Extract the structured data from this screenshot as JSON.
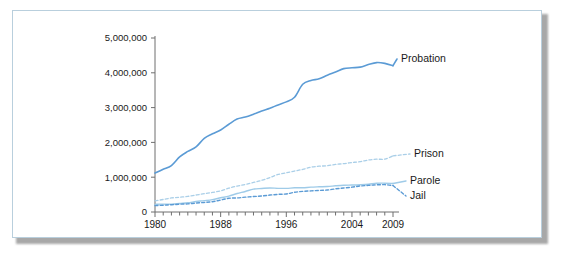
{
  "chart_data": {
    "type": "line",
    "title": "",
    "xlabel": "",
    "ylabel": "",
    "xlim": [
      1980,
      2009
    ],
    "ylim": [
      0,
      5000000
    ],
    "grid": false,
    "legend_position": "inline-right",
    "ytick_labels": [
      "0",
      "1,000,000",
      "2,000,000",
      "3,000,000",
      "4,000,000",
      "5,000,000"
    ],
    "ytick_values": [
      0,
      1000000,
      2000000,
      3000000,
      4000000,
      5000000
    ],
    "xtick_labels": [
      "1980",
      "1988",
      "1996",
      "2004",
      "2009"
    ],
    "xtick_values": [
      1980,
      1988,
      1996,
      2004,
      2009
    ],
    "x_minor_tick_interval": 1,
    "x": [
      1980,
      1981,
      1982,
      1983,
      1984,
      1985,
      1986,
      1987,
      1988,
      1989,
      1990,
      1991,
      1992,
      1993,
      1994,
      1995,
      1996,
      1997,
      1998,
      1999,
      2000,
      2001,
      2002,
      2003,
      2004,
      2005,
      2006,
      2007,
      2008,
      2009
    ],
    "series": [
      {
        "name": "Probation",
        "label": "Probation",
        "color": "#5b9bd5",
        "style": "solid",
        "width": 1.6,
        "values": [
          1118097,
          1225934,
          1335359,
          1582947,
          1740948,
          1870132,
          2114621,
          2247158,
          2356483,
          2522125,
          2670234,
          2728472,
          2811611,
          2903061,
          2981022,
          3077861,
          3164996,
          3296513,
          3670441,
          3779922,
          3826209,
          3931731,
          4024067,
          4120012,
          4143792,
          4162536,
          4236800,
          4293163,
          4270917,
          4203967
        ]
      },
      {
        "name": "Prison",
        "label": "Prison",
        "color": "#aacfe8",
        "style": "dashed",
        "width": 1.3,
        "values": [
          319598,
          360029,
          402914,
          423898,
          448264,
          487593,
          526436,
          562814,
          607766,
          683367,
          743382,
          792535,
          850566,
          909381,
          990147,
          1078542,
          1127528,
          1176564,
          1224469,
          1287172,
          1316333,
          1330007,
          1367547,
          1390279,
          1421345,
          1448344,
          1492973,
          1517867,
          1518559,
          1613740
        ]
      },
      {
        "name": "Parole",
        "label": "Parole",
        "color": "#9fcbe8",
        "style": "solid",
        "width": 1.4,
        "values": [
          220438,
          225539,
          224604,
          246440,
          266992,
          300203,
          325638,
          355505,
          407977,
          456803,
          531407,
          590442,
          658601,
          676100,
          690371,
          679421,
          679733,
          694787,
          696385,
          714457,
          723898,
          732333,
          753141,
          769925,
          775623,
          784408,
          798202,
          824365,
          828169,
          819308
        ]
      },
      {
        "name": "Jail",
        "label": "Jail",
        "color": "#5b9bd5",
        "style": "dashed",
        "width": 1.4,
        "values": [
          182288,
          195085,
          209582,
          223551,
          234500,
          256615,
          274444,
          295873,
          343569,
          395553,
          405320,
          426479,
          444584,
          459804,
          486474,
          507044,
          518492,
          567079,
          592462,
          605943,
          621149,
          631240,
          665475,
          691301,
          713990,
          747529,
          765819,
          780174,
          785533,
          760400
        ]
      }
    ]
  }
}
